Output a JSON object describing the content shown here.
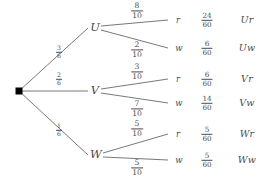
{
  "diagram": {
    "type": "probability-tree",
    "root": {
      "label": "",
      "shape": "filled-square"
    },
    "level1": [
      {
        "id": "U",
        "label": "U",
        "prob_num": "3",
        "prob_den": "6"
      },
      {
        "id": "V",
        "label": "V",
        "prob_num": "2",
        "prob_den": "6"
      },
      {
        "id": "W",
        "label": "W",
        "prob_num": "1",
        "prob_den": "6"
      }
    ],
    "level2": [
      {
        "id": "Ur",
        "label": "r",
        "prob_num": "8",
        "prob_den": "10"
      },
      {
        "id": "Uw",
        "label": "w",
        "prob_num": "2",
        "prob_den": "10"
      },
      {
        "id": "Vr",
        "label": "r",
        "prob_num": "3",
        "prob_den": "10"
      },
      {
        "id": "Vw",
        "label": "w",
        "prob_num": "7",
        "prob_den": "10"
      },
      {
        "id": "Wr",
        "label": "r",
        "prob_num": "5",
        "prob_den": "10"
      },
      {
        "id": "Ww",
        "label": "w",
        "prob_num": "5",
        "prob_den": "10"
      }
    ],
    "outcomes": [
      {
        "id": "Ur",
        "prob_num": "24",
        "prob_den": "60",
        "name": "Ur"
      },
      {
        "id": "Uw",
        "prob_num": "6",
        "prob_den": "60",
        "name": "Uw"
      },
      {
        "id": "Vr",
        "prob_num": "6",
        "prob_den": "60",
        "name": "Vr"
      },
      {
        "id": "Vw",
        "prob_num": "14",
        "prob_den": "60",
        "name": "Vw"
      },
      {
        "id": "Wr",
        "prob_num": "5",
        "prob_den": "60",
        "name": "Wr"
      },
      {
        "id": "Ww",
        "prob_num": "5",
        "prob_den": "60",
        "name": "Ww"
      }
    ],
    "colors": {
      "line": "#555555",
      "text": "#4a4a4a",
      "background": "#ffffff",
      "root_dot": "#000000"
    }
  }
}
